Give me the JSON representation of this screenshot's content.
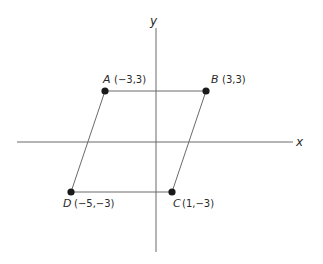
{
  "diagram": {
    "type": "coordinate-plane-parallelogram",
    "axes": {
      "x_label": "x",
      "y_label": "y"
    },
    "points": [
      {
        "name": "A",
        "coords": "(−3,3)",
        "x": -3,
        "y": 3
      },
      {
        "name": "B",
        "coords": "(3,3)",
        "x": 3,
        "y": 3
      },
      {
        "name": "C",
        "coords": "(1,−3)",
        "x": 1,
        "y": -3
      },
      {
        "name": "D",
        "coords": "(−5,−3)",
        "x": -5,
        "y": -3
      }
    ],
    "edges": [
      [
        "A",
        "B"
      ],
      [
        "B",
        "C"
      ],
      [
        "C",
        "D"
      ],
      [
        "D",
        "A"
      ]
    ],
    "colors": {
      "line": "#6a6a6a",
      "dot": "#1a1a1a",
      "text": "#2a2a2a",
      "background": "#ffffff"
    }
  }
}
